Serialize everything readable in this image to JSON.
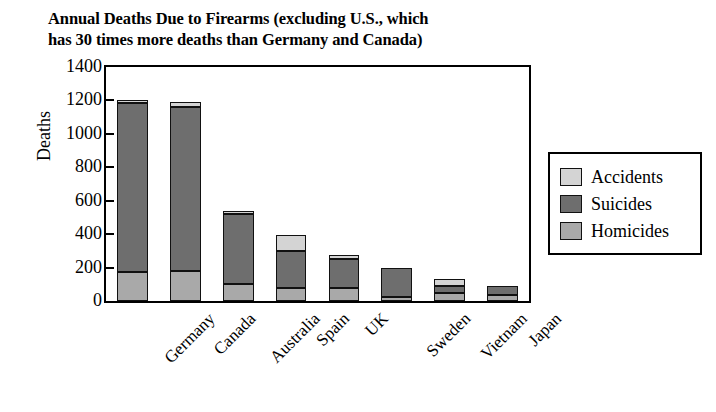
{
  "chart_data": {
    "type": "bar",
    "subtype": "stacked-bar",
    "title": "Annual Deaths Due to Firearms (excluding U.S., which has 30 times more deaths than Germany and Canada)",
    "title_lines": [
      "Annual Deaths Due to Firearms (excluding U.S., which",
      "has 30 times more deaths than Germany and Canada)"
    ],
    "xlabel": "",
    "ylabel": "Deaths",
    "ylim": [
      0,
      1400
    ],
    "ytick_step": 200,
    "yticks": [
      0,
      200,
      400,
      600,
      800,
      1000,
      1200,
      1400
    ],
    "ytick_labels": [
      "0",
      "200",
      "400",
      "600",
      "800",
      "1000",
      "1200",
      "1400"
    ],
    "grid": false,
    "legend_position": "right",
    "categories": [
      "Germany",
      "Canada",
      "Australia",
      "Spain",
      "UK",
      "Sweden",
      "Vietnam",
      "Japan"
    ],
    "series": [
      {
        "name": "Homicides",
        "color": "#a9a9a9",
        "values": [
          175,
          180,
          100,
          75,
          75,
          25,
          50,
          35
        ]
      },
      {
        "name": "Suicides",
        "color": "#6e6e6e",
        "values": [
          1010,
          980,
          420,
          225,
          175,
          175,
          40,
          55
        ]
      },
      {
        "name": "Accidents",
        "color": "#d4d4d4",
        "values": [
          15,
          30,
          10,
          95,
          25,
          0,
          40,
          0
        ]
      }
    ],
    "totals": [
      1200,
      1190,
      530,
      395,
      275,
      200,
      130,
      90
    ],
    "stack_order_bottom_to_top": [
      "Homicides",
      "Suicides",
      "Accidents"
    ]
  },
  "legend": {
    "items": [
      {
        "label": "Accidents",
        "color": "#d4d4d4"
      },
      {
        "label": "Suicides",
        "color": "#6e6e6e"
      },
      {
        "label": "Homicides",
        "color": "#a9a9a9"
      }
    ]
  }
}
